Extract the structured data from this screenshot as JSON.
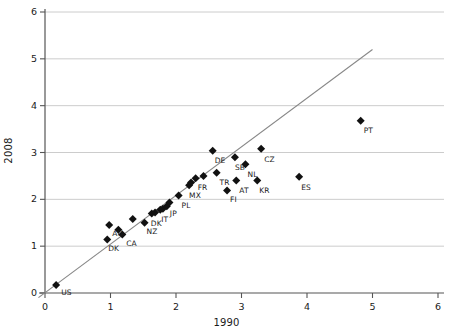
{
  "chart_data": {
    "type": "scatter",
    "title": "",
    "xlabel": "1990",
    "ylabel": "2008",
    "xlim": [
      0,
      6
    ],
    "ylim": [
      0,
      6
    ],
    "xticks": [
      0,
      1,
      2,
      3,
      4,
      5,
      6
    ],
    "yticks": [
      0,
      1,
      2,
      3,
      4,
      5,
      6
    ],
    "xticklabels": [
      "0",
      "1",
      "2",
      "3",
      "4",
      "5",
      "6"
    ],
    "yticklabels": [
      "0",
      "1",
      "2",
      "3",
      "4",
      "5",
      "6"
    ],
    "grid": "horizontal",
    "legend": "none",
    "reference_line": {
      "name": "identity-line",
      "type": "line",
      "x": [
        -0.1,
        5.0
      ],
      "y": [
        -0.1,
        5.2
      ],
      "color": "#888888"
    },
    "marker": {
      "shape": "diamond",
      "color": "#111111",
      "size": 4
    },
    "points": [
      {
        "label": "US",
        "x": 0.17,
        "y": 0.17,
        "label_dx": 5,
        "label_dy": 7
      },
      {
        "label": "DK",
        "x": 0.95,
        "y": 1.14,
        "label_dx": 1,
        "label_dy": 8
      },
      {
        "label": "AU",
        "x": 0.98,
        "y": 1.45,
        "label_dx": 3,
        "label_dy": 8
      },
      {
        "label": "",
        "x": 1.12,
        "y": 1.35,
        "label_dx": 0,
        "label_dy": 0
      },
      {
        "label": "CA",
        "x": 1.18,
        "y": 1.25,
        "label_dx": 4,
        "label_dy": 9
      },
      {
        "label": "",
        "x": 1.34,
        "y": 1.58,
        "label_dx": 0,
        "label_dy": 0
      },
      {
        "label": "NZ",
        "x": 1.52,
        "y": 1.5,
        "label_dx": 2,
        "label_dy": 8
      },
      {
        "label": "DK",
        "x": 1.63,
        "y": 1.7,
        "label_dx": -1,
        "label_dy": 10
      },
      {
        "label": "",
        "x": 1.68,
        "y": 1.72,
        "label_dx": 0,
        "label_dy": 0
      },
      {
        "label": "IT",
        "x": 1.76,
        "y": 1.78,
        "label_dx": 1,
        "label_dy": 9
      },
      {
        "label": "",
        "x": 1.8,
        "y": 1.8,
        "label_dx": 0,
        "label_dy": 0
      },
      {
        "label": "JP",
        "x": 1.86,
        "y": 1.85,
        "label_dx": 3,
        "label_dy": 7
      },
      {
        "label": "",
        "x": 1.9,
        "y": 1.93,
        "label_dx": 0,
        "label_dy": 0
      },
      {
        "label": "PL",
        "x": 2.04,
        "y": 2.08,
        "label_dx": 3,
        "label_dy": 9
      },
      {
        "label": "MX",
        "x": 2.2,
        "y": 2.3,
        "label_dx": 0,
        "label_dy": 10
      },
      {
        "label": "",
        "x": 2.23,
        "y": 2.36,
        "label_dx": 0,
        "label_dy": 0
      },
      {
        "label": "FR",
        "x": 2.3,
        "y": 2.45,
        "label_dx": 2,
        "label_dy": 9
      },
      {
        "label": "",
        "x": 2.42,
        "y": 2.5,
        "label_dx": 0,
        "label_dy": 0
      },
      {
        "label": "DE",
        "x": 2.56,
        "y": 3.04,
        "label_dx": 2,
        "label_dy": 9
      },
      {
        "label": "TR",
        "x": 2.62,
        "y": 2.57,
        "label_dx": 3,
        "label_dy": 9
      },
      {
        "label": "FI",
        "x": 2.78,
        "y": 2.19,
        "label_dx": 3,
        "label_dy": 9
      },
      {
        "label": "SB",
        "x": 2.9,
        "y": 2.9,
        "label_dx": 0,
        "label_dy": 10
      },
      {
        "label": "AT",
        "x": 2.92,
        "y": 2.4,
        "label_dx": 3,
        "label_dy": 9
      },
      {
        "label": "NL",
        "x": 3.06,
        "y": 2.75,
        "label_dx": 2,
        "label_dy": 10
      },
      {
        "label": "KR",
        "x": 3.24,
        "y": 2.4,
        "label_dx": 2,
        "label_dy": 9
      },
      {
        "label": "CZ",
        "x": 3.3,
        "y": 3.08,
        "label_dx": 3,
        "label_dy": 10
      },
      {
        "label": "ES",
        "x": 3.88,
        "y": 2.48,
        "label_dx": 2,
        "label_dy": 10
      },
      {
        "label": "PT",
        "x": 4.82,
        "y": 3.68,
        "label_dx": 3,
        "label_dy": 9
      }
    ]
  },
  "colors": {
    "axis": "#555555",
    "grid": "#cccccc",
    "marker": "#111111",
    "line": "#8a8a8a",
    "text": "#1a1a1a"
  }
}
